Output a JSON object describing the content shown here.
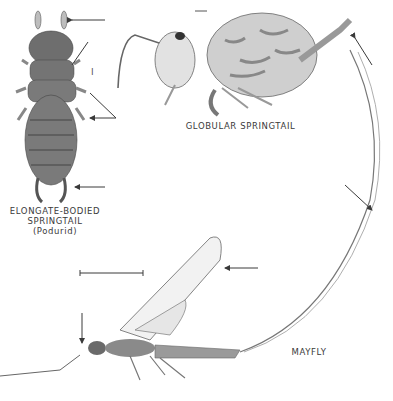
{
  "figure": {
    "specimens": [
      {
        "id": "elongate",
        "label_lines": [
          "ELONGATE-BODIED",
          "SPRINGTAIL",
          "(Podurid)"
        ],
        "scale_mark": "I",
        "arrow_count": 4
      },
      {
        "id": "globular",
        "label_lines": [
          "GLOBULAR SPRINGTAIL"
        ],
        "scale_mark": "⊢",
        "arrow_count": 1
      },
      {
        "id": "mayfly",
        "label_lines": [
          "MAYFLY"
        ],
        "scale_mark": "scale bar",
        "arrow_count": 3
      }
    ],
    "colors": {
      "ink": "#3a3a3a",
      "body_shade": "#7a7a7a",
      "background": "#ffffff"
    }
  }
}
